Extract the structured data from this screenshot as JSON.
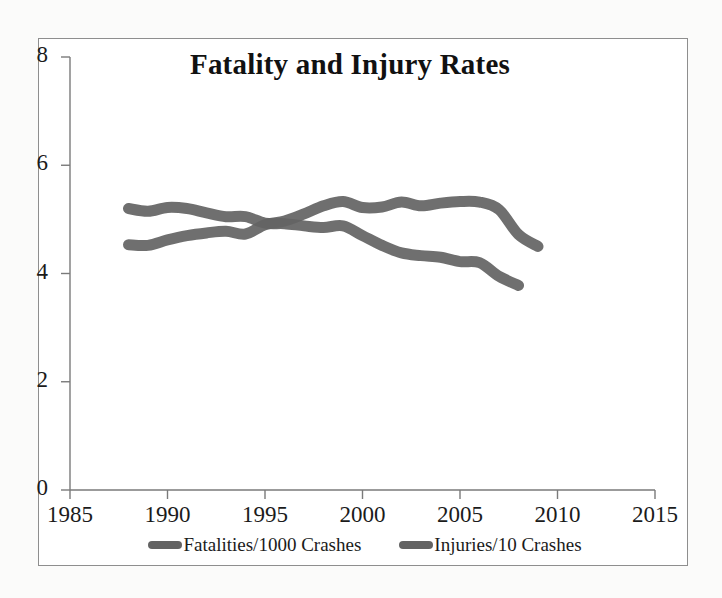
{
  "figure": {
    "frame_border_color": "#8e8e8e",
    "background_color": "#ffffff"
  },
  "chart_data": {
    "type": "line",
    "title": "Fatality and Injury Rates",
    "xlabel": "",
    "ylabel": "",
    "xlim": [
      1985,
      2015
    ],
    "ylim": [
      0,
      8
    ],
    "xticks": [
      1985,
      1990,
      1995,
      2000,
      2005,
      2010,
      2015
    ],
    "yticks": [
      0,
      2,
      4,
      6,
      8
    ],
    "xtick_labels": [
      "1985",
      "1990",
      "1995",
      "2000",
      "2005",
      "2010",
      "2015"
    ],
    "ytick_labels": [
      "0",
      "2",
      "4",
      "6",
      "8"
    ],
    "grid": false,
    "legend_position": "bottom",
    "series_color": "#636363",
    "series": [
      {
        "name": "Fatalities/1000 Crashes",
        "color": "#636363",
        "x": [
          1988,
          1989,
          1990,
          1991,
          1992,
          1993,
          1994,
          1995,
          1996,
          1997,
          1998,
          1999,
          2000,
          2001,
          2002,
          2003,
          2004,
          2005,
          2006,
          2007,
          2008
        ],
        "values": [
          5.2,
          5.15,
          5.22,
          5.2,
          5.12,
          5.05,
          5.05,
          4.93,
          4.92,
          4.88,
          4.85,
          4.88,
          4.7,
          4.52,
          4.38,
          4.33,
          4.3,
          4.22,
          4.2,
          3.95,
          3.78
        ]
      },
      {
        "name": "Injuries/10 Crashes",
        "color": "#636363",
        "x": [
          1988,
          1989,
          1990,
          1991,
          1992,
          1993,
          1994,
          1995,
          1996,
          1997,
          1998,
          1999,
          2000,
          2001,
          2002,
          2003,
          2004,
          2005,
          2006,
          2007,
          2008,
          2009
        ],
        "values": [
          4.53,
          4.52,
          4.62,
          4.7,
          4.75,
          4.78,
          4.73,
          4.9,
          4.97,
          5.1,
          5.25,
          5.33,
          5.22,
          5.23,
          5.32,
          5.25,
          5.3,
          5.33,
          5.32,
          5.18,
          4.72,
          4.5
        ]
      }
    ],
    "notes": {
      "fatalities_end_value": 3.65,
      "injuries_end_value": 4.5,
      "crossover_year": 1995
    }
  },
  "legend": {
    "entries": [
      {
        "label": "Fatalities/1000 Crashes",
        "swatch": "line-swatch"
      },
      {
        "label": "Injuries/10 Crashes",
        "swatch": "line-swatch"
      }
    ]
  }
}
